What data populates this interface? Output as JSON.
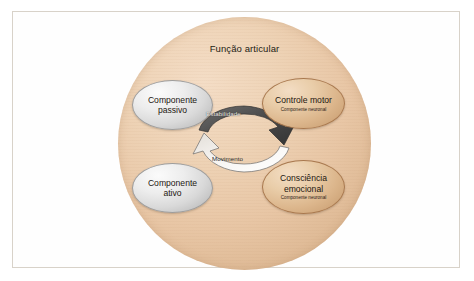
{
  "figure": {
    "circle_title": "Função articular",
    "background_color": "#e8c6a5",
    "frame_color": "#d8d2c9",
    "nodes": [
      {
        "id": "componente-passivo",
        "title": "Componente",
        "title_line2": "passivo",
        "subtitle": "",
        "style": "gray",
        "position": "top-left"
      },
      {
        "id": "componente-ativo",
        "title": "Componente",
        "title_line2": "ativo",
        "subtitle": "",
        "style": "gray",
        "position": "bottom-left"
      },
      {
        "id": "controle-motor",
        "title": "Controle motor",
        "title_line2": "",
        "subtitle": "Componente neuronal",
        "style": "tan",
        "position": "top-right"
      },
      {
        "id": "consciencia-emocional",
        "title": "Consciência",
        "title_line2": "emocional",
        "subtitle": "Componente neuronal",
        "style": "tan",
        "position": "bottom-right"
      }
    ],
    "cycle": {
      "top_arrow_label": "Estabilidade",
      "bottom_arrow_label": "Movimento",
      "top_arrow_color": "#4a4a4a",
      "bottom_arrow_color": "#ffffff"
    }
  }
}
